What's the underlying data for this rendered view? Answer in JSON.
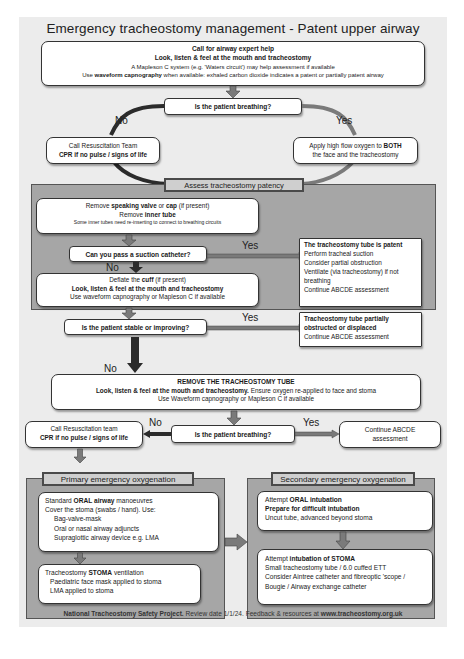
{
  "title": "Emergency tracheostomy management - Patent upper airway",
  "top_box": {
    "line1": "Call for airway expert help",
    "line2": "Look, listen & feel at the mouth and tracheostomy",
    "line3": "A Mapleson C system (e.g. 'Waters circuit') may help assessment if available",
    "line4_prefix": "Use ",
    "line4_bold": "waveform capnography",
    "line4_suffix": " when available:  exhaled carbon dioxide indicates a patent or partially patent airway"
  },
  "q_breathing_1": "Is the patient breathing?",
  "labels": {
    "no": "No",
    "yes": "Yes"
  },
  "resus_1": {
    "line1": "Call Resuscitation Team",
    "line2": "CPR if no pulse / signs of life"
  },
  "oxygen_box": {
    "line1_prefix": "Apply high flow oxygen to ",
    "line1_bold": "BOTH",
    "line2": "the face and the tracheostomy"
  },
  "assess_panel": {
    "label": "Assess tracheostomy patency"
  },
  "remove_box": {
    "l1_a": "Remove ",
    "l1_b": "speaking valve",
    "l1_c": " or ",
    "l1_d": "cap",
    "l1_e": " (if present)",
    "l2_a": "Remove ",
    "l2_b": "inner tube",
    "l3": "Some inner tubes need re-inserting to connect to breathing circuits"
  },
  "q_suction": "Can you pass a suction catheter?",
  "patent_box": {
    "heading": "The tracheostomy tube is patent",
    "lines": [
      "Perform tracheal suction",
      "Consider partial obstruction",
      "Ventilate (via tracheostomy) if not breathing",
      "Continue ABCDE assessment"
    ]
  },
  "deflate_box": {
    "l1_a": "Deflate the ",
    "l1_b": "cuff",
    "l1_c": " (if present)",
    "l2": "Look, listen & feel at the mouth and tracheostomy",
    "l3": "Use waveform capnography or Mapleson C if available"
  },
  "q_stable": "Is the patient stable or improving?",
  "partial_box": {
    "heading": "Tracheostomy tube partially obstructed or displaced",
    "line": "Continue ABCDE assessment"
  },
  "remove_tube_box": {
    "l1": "REMOVE THE TRACHEOSTOMY TUBE",
    "l2_bold": "Look, listen & feel at the mouth and tracheostomy.",
    "l2_rest": " Ensure oxygen re-applied to face and stoma",
    "l3": "Use Waveform capnography or Mapleson C if available"
  },
  "q_breathing_2": "Is the patient breathing?",
  "resus_2": {
    "line1": "Call Resuscitation team",
    "line2": "CPR if no pulse / signs of life"
  },
  "continue_box": "Continue ABCDE assessment",
  "primary_panel": {
    "label": "Primary emergency oxygenation",
    "box1": {
      "l1_a": "Standard ",
      "l1_b": "ORAL airway",
      "l1_c": " manoeuvres",
      "l2": "Cover the stoma (swabs / hand). Use:",
      "items": [
        "Bag-valve-mask",
        "Oral or nasal airway adjuncts",
        "Supraglottic airway device e.g. LMA"
      ]
    },
    "box2": {
      "l1_a": "Tracheostomy ",
      "l1_b": "STOMA",
      "l1_c": " ventilation",
      "items": [
        "Paediatric face mask applied to stoma",
        "LMA applied to stoma"
      ]
    }
  },
  "secondary_panel": {
    "label": "Secondary emergency oxygenation",
    "box1": {
      "l1_a": "Attempt ",
      "l1_b": "ORAL intubation",
      "l2": "Prepare for difficult intubation",
      "l3": "Uncut tube, advanced beyond stoma"
    },
    "box2": {
      "l1_a": "Attempt ",
      "l1_b": "intubation of STOMA",
      "lines": [
        "Small tracheostomy tube / 6.0 cuffed ETT",
        "Consider Aintree catheter and fibreoptic 'scope / Bougie / Airway exchange catheter"
      ]
    }
  },
  "footer": {
    "bold1": "National Tracheostomy Safety Project.",
    "mid": " Review date 1/1/24. Feedback & resources at ",
    "bold2": "www.tracheostomy.org.uk"
  },
  "colors": {
    "background": "#ececec",
    "panel": "#a6a6a6",
    "panel_label": "#cfcfcf",
    "box": "#ffffff",
    "arrow_dark": "#2b2b2b",
    "arrow_mid": "#7a7a7a"
  }
}
